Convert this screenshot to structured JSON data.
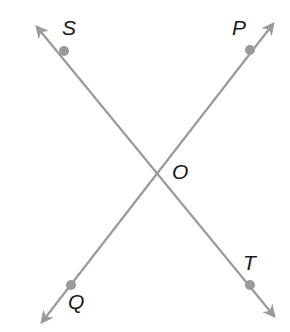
{
  "diagram": {
    "line_color": "#9a9a9a",
    "point_color": "#9a9a9a",
    "label_color": "#1a1a1a",
    "lines": [
      {
        "name": "line-ST",
        "start": [
          37,
          27
        ],
        "end": [
          274,
          316
        ],
        "arrow_both_ends": true
      },
      {
        "name": "line-PQ",
        "start": [
          273,
          24
        ],
        "end": [
          42,
          322
        ],
        "arrow_both_ends": true
      }
    ],
    "points": [
      {
        "id": "S",
        "label": "S",
        "x": 64,
        "y": 51,
        "dot": true,
        "label_x": 62,
        "label_y": 35
      },
      {
        "id": "P",
        "label": "P",
        "x": 250,
        "y": 50,
        "dot": true,
        "label_x": 232,
        "label_y": 35
      },
      {
        "id": "O",
        "label": "O",
        "x": 156,
        "y": 171,
        "dot": false,
        "label_x": 172,
        "label_y": 179
      },
      {
        "id": "T",
        "label": "T",
        "x": 250,
        "y": 285,
        "dot": true,
        "label_x": 243,
        "label_y": 270
      },
      {
        "id": "Q",
        "label": "Q",
        "x": 71,
        "y": 285,
        "dot": true,
        "label_x": 68,
        "label_y": 309
      }
    ]
  }
}
